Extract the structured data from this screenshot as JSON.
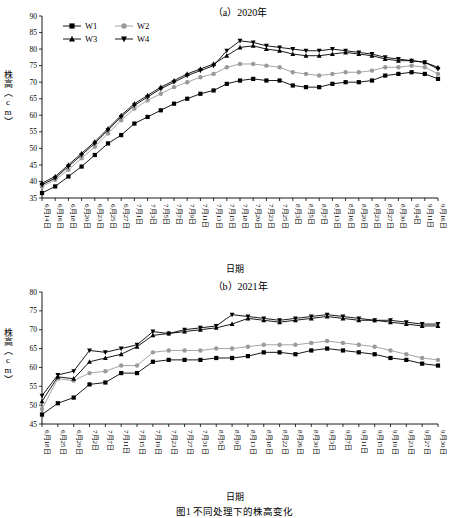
{
  "figure": {
    "caption": "图1 不同处理下的株高变化",
    "y_axis_label": "株高（cm）",
    "x_axis_label": "日期"
  },
  "legend": {
    "entries": [
      {
        "label": "W1",
        "marker": "square"
      },
      {
        "label": "W2",
        "marker": "circle"
      },
      {
        "label": "W3",
        "marker": "triangle-up"
      },
      {
        "label": "W4",
        "marker": "triangle-down"
      }
    ]
  },
  "chart_data": [
    {
      "type": "line",
      "title": "（a）2020年",
      "xlabel": "日期",
      "ylabel": "株高（cm）",
      "ylim": [
        35,
        90
      ],
      "yticks": [
        35,
        40,
        45,
        50,
        55,
        60,
        65,
        70,
        75,
        80,
        85,
        90
      ],
      "grid": false,
      "legend_position": "top-left",
      "categories": [
        "6月14日",
        "6月16日",
        "6月18日",
        "6月20日",
        "6月23日",
        "6月25日",
        "6月27日",
        "7月1日",
        "7月3日",
        "7月5日",
        "7月7日",
        "7月9日",
        "7月11日",
        "7月13日",
        "7月15日",
        "7月18日",
        "7月20日",
        "7月23日",
        "7月25日",
        "8月3日",
        "8月5日",
        "8月7日",
        "8月13日",
        "8月16日",
        "8月20日",
        "8月23日",
        "8月27日",
        "8月30日",
        "9月4日",
        "9月11日",
        "9月16日"
      ],
      "series": [
        {
          "name": "W1",
          "marker": "square",
          "values": [
            36.5,
            38.5,
            41.5,
            44.5,
            48.0,
            51.5,
            54.0,
            57.5,
            59.5,
            61.5,
            63.5,
            65.0,
            66.5,
            67.5,
            69.5,
            70.5,
            71.0,
            70.5,
            70.5,
            69.0,
            68.5,
            68.5,
            69.5,
            70.0,
            70.0,
            70.5,
            72.0,
            72.5,
            73.0,
            72.5,
            71.0
          ]
        },
        {
          "name": "W2",
          "marker": "circle",
          "values": [
            38.5,
            40.5,
            43.5,
            47.0,
            50.5,
            54.5,
            58.5,
            62.0,
            64.5,
            66.5,
            68.5,
            70.0,
            71.5,
            72.5,
            74.5,
            75.5,
            75.5,
            75.0,
            74.5,
            73.0,
            72.5,
            72.0,
            72.5,
            73.0,
            73.0,
            73.5,
            74.5,
            74.5,
            75.0,
            74.5,
            72.5
          ]
        },
        {
          "name": "W3",
          "marker": "triangle-up",
          "values": [
            39.5,
            41.5,
            45.0,
            48.5,
            52.0,
            56.0,
            60.0,
            63.5,
            66.0,
            68.5,
            70.5,
            72.5,
            74.0,
            75.5,
            78.0,
            80.5,
            81.0,
            80.0,
            79.5,
            78.5,
            78.0,
            78.0,
            78.5,
            79.0,
            78.5,
            78.0,
            77.0,
            76.5,
            76.5,
            76.0,
            74.5
          ]
        },
        {
          "name": "W4",
          "marker": "triangle-down",
          "values": [
            39.0,
            41.0,
            44.5,
            48.0,
            51.5,
            55.5,
            59.5,
            63.0,
            65.5,
            68.0,
            70.0,
            72.0,
            73.5,
            75.0,
            79.5,
            82.5,
            82.0,
            81.0,
            80.5,
            80.0,
            79.5,
            79.5,
            80.0,
            79.5,
            79.0,
            78.5,
            77.5,
            77.0,
            76.5,
            76.0,
            74.0
          ]
        }
      ]
    },
    {
      "type": "line",
      "title": "（b）2021年",
      "xlabel": "日期",
      "ylabel": "株高（cm）",
      "ylim": [
        45,
        80
      ],
      "yticks": [
        45,
        50,
        55,
        60,
        65,
        70,
        75,
        80
      ],
      "grid": false,
      "legend_position": "none",
      "categories": [
        "6月18日",
        "6月25日",
        "6月29日",
        "7月2日",
        "7月7日",
        "7月11日",
        "7月15日",
        "7月19日",
        "7月23日",
        "7月27日",
        "7月31日",
        "8月5日",
        "8月9日",
        "8月13日",
        "8月18日",
        "8月22日",
        "8月26日",
        "8月30日",
        "9月3日",
        "9月7日",
        "9月11日",
        "9月15日",
        "9月19日",
        "9月23日",
        "9月27日",
        "9月30日"
      ],
      "series": [
        {
          "name": "W1",
          "marker": "square",
          "values": [
            47.5,
            50.5,
            52.0,
            55.5,
            56.0,
            58.5,
            58.5,
            61.5,
            62.0,
            62.0,
            62.0,
            62.5,
            62.5,
            63.0,
            64.0,
            64.0,
            63.5,
            64.5,
            65.0,
            64.5,
            64.0,
            63.5,
            62.5,
            62.0,
            61.0,
            60.5
          ]
        },
        {
          "name": "W2",
          "marker": "circle",
          "values": [
            49.0,
            57.0,
            56.5,
            58.5,
            59.0,
            60.5,
            60.5,
            64.0,
            64.5,
            64.5,
            64.5,
            65.0,
            65.0,
            65.5,
            66.0,
            66.0,
            66.0,
            66.5,
            67.0,
            66.5,
            66.0,
            65.5,
            64.5,
            63.5,
            62.5,
            62.0
          ]
        },
        {
          "name": "W3",
          "marker": "triangle-up",
          "values": [
            51.0,
            57.5,
            57.0,
            61.5,
            62.5,
            63.5,
            65.5,
            68.5,
            69.0,
            69.5,
            70.0,
            70.5,
            71.5,
            73.0,
            72.5,
            72.0,
            72.5,
            73.0,
            73.5,
            73.0,
            72.5,
            72.5,
            72.0,
            71.5,
            71.0,
            71.0
          ]
        },
        {
          "name": "W4",
          "marker": "triangle-down",
          "values": [
            52.5,
            58.0,
            59.0,
            64.5,
            64.0,
            65.0,
            66.0,
            69.5,
            69.0,
            70.0,
            70.5,
            71.0,
            74.0,
            73.5,
            73.0,
            72.5,
            73.0,
            73.5,
            74.0,
            73.5,
            73.0,
            72.5,
            72.5,
            72.0,
            71.5,
            71.5
          ]
        }
      ]
    }
  ]
}
